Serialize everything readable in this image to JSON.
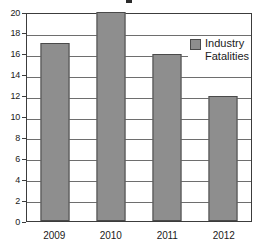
{
  "chart_data": {
    "type": "bar",
    "title": "",
    "xlabel": "",
    "ylabel": "",
    "categories": [
      "2009",
      "2010",
      "2011",
      "2012"
    ],
    "series": [
      {
        "name": "Industry Fatalities",
        "values": [
          17,
          20,
          16,
          12
        ]
      }
    ],
    "ylim": [
      0,
      20
    ],
    "ytick_step": 2,
    "yticks": [
      "20",
      "18",
      "16",
      "14",
      "12",
      "10",
      "8",
      "6",
      "4",
      "2",
      "0"
    ],
    "grid": true,
    "legend": {
      "position": "top-right",
      "entries": [
        {
          "label_line1": "Industry",
          "label_line2": "Fatalities",
          "color": "#8e8e8e"
        }
      ]
    },
    "colors": {
      "bar_fill": "#8e8e8e",
      "bar_border": "#4a4a4a",
      "gridline": "#6e6e6e",
      "axis": "#3c3c3c",
      "background": "#ffffff",
      "text": "#1a1a1a"
    }
  }
}
